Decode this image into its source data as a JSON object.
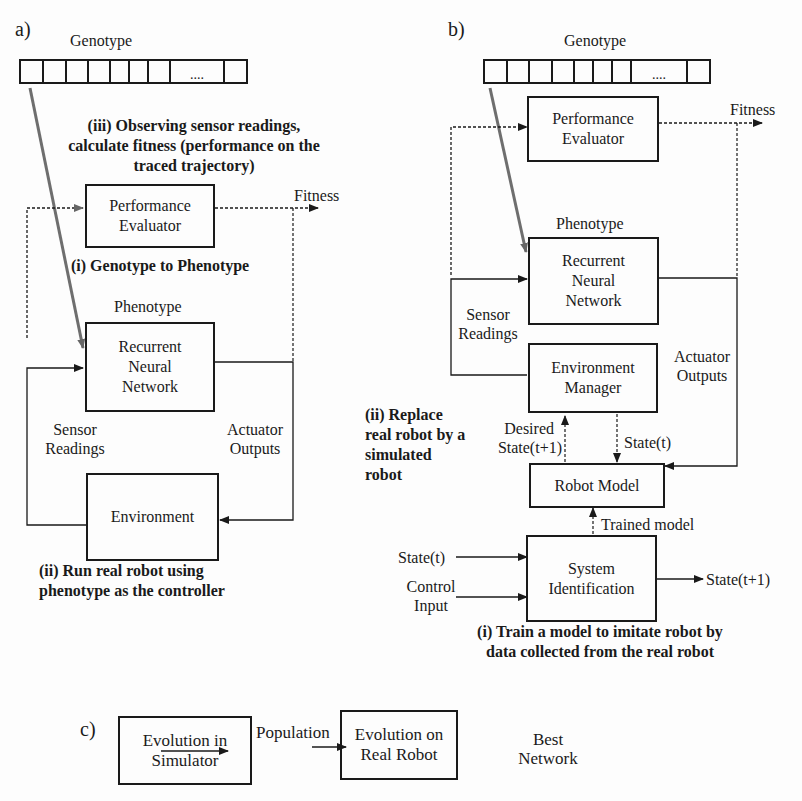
{
  "panel_a": {
    "label": "a)",
    "genotype_label": "Genotype",
    "genotype_ellipsis": "....",
    "step_iii": [
      "(iii) Observing sensor readings,",
      "calculate fitness (performance on the",
      "traced trajectory)"
    ],
    "performance_evaluator": [
      "Performance",
      "Evaluator"
    ],
    "fitness_label": "Fitness",
    "step_i": "(i) Genotype to Phenotype",
    "phenotype_label": "Phenotype",
    "rnn_box": [
      "Recurrent",
      "Neural",
      "Network"
    ],
    "sensor_readings": [
      "Sensor",
      "Readings"
    ],
    "actuator_outputs": [
      "Actuator",
      "Outputs"
    ],
    "environment_box": "Environment",
    "step_ii": [
      "(ii) Run real robot using",
      "phenotype as the controller"
    ]
  },
  "panel_b": {
    "label": "b)",
    "genotype_label": "Genotype",
    "genotype_ellipsis": "....",
    "performance_evaluator": [
      "Performance",
      "Evaluator"
    ],
    "fitness_label": "Fitness",
    "phenotype_label": "Phenotype",
    "rnn_box": [
      "Recurrent",
      "Neural",
      "Network"
    ],
    "sensor_readings": [
      "Sensor",
      "Readings"
    ],
    "environment_manager_box": [
      "Environment",
      "Manager"
    ],
    "actuator_outputs": [
      "Actuator",
      "Outputs"
    ],
    "step_ii": [
      "(ii) Replace",
      "real robot by a",
      "simulated",
      "robot"
    ],
    "desired_state": [
      "Desired",
      "State(t+1)"
    ],
    "state_t_down": "State(t)",
    "robot_model_box": "Robot Model",
    "trained_model": "Trained model",
    "input_state_t": "State(t)",
    "input_control": [
      "Control",
      "Input"
    ],
    "system_identification_box": [
      "System",
      "Identification"
    ],
    "output_state": "State(t+1)",
    "step_i": [
      "(i) Train a model to imitate robot by",
      "data collected from the real robot"
    ]
  },
  "panel_c": {
    "label": "c)",
    "sim_box": [
      "Evolution in",
      "Simulator"
    ],
    "population_label": "Population",
    "real_box": [
      "Evolution on",
      "Real Robot"
    ],
    "best_network": [
      "Best",
      "Network"
    ]
  }
}
